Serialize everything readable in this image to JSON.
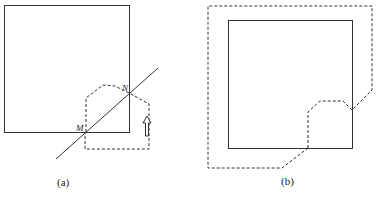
{
  "figures": [
    {
      "id": "a",
      "caption": "(a)",
      "points": {
        "M": "M",
        "N": "N"
      }
    },
    {
      "id": "b",
      "caption": "(b)"
    }
  ],
  "colors": {
    "stroke": "#333333",
    "background": "#ffffff"
  }
}
